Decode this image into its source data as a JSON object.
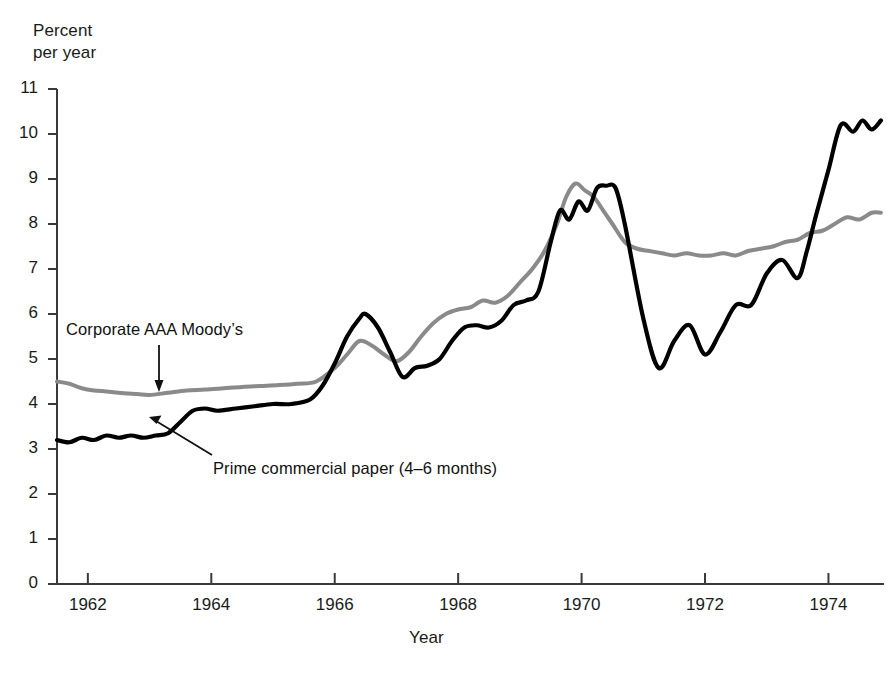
{
  "chart_data": {
    "type": "line",
    "title": "",
    "ylabel": "Percent\nper year",
    "xlabel": "Year",
    "ylim": [
      0,
      11
    ],
    "xlim": [
      1961.5,
      1974.9
    ],
    "yticks": [
      0,
      1,
      2,
      3,
      4,
      5,
      6,
      7,
      8,
      9,
      10,
      11
    ],
    "ytick_labels": [
      "0",
      "1",
      "2",
      "3",
      "4",
      "5",
      "6",
      "7",
      "8",
      "9",
      "10",
      "11"
    ],
    "xticks": [
      1962,
      1964,
      1966,
      1968,
      1970,
      1972,
      1974
    ],
    "xtick_labels": [
      "1962",
      "1964",
      "1966",
      "1968",
      "1970",
      "1972",
      "1974"
    ],
    "grid": false,
    "legend_position": "inline-annotations",
    "annotations": [
      {
        "name": "corporate-aaa-moodys-label",
        "text": "Corporate AAA Moody’s",
        "points_to_series": "Corporate AAA Moody’s",
        "arrow": "down"
      },
      {
        "name": "prime-commercial-paper-label",
        "text": "Prime commercial paper (4–6 months)",
        "points_to_series": "Prime commercial paper (4–6 months)",
        "arrow": "up-left"
      }
    ],
    "series": [
      {
        "name": "Corporate AAA Moody’s",
        "color": "#8a8a8a",
        "width": 4.0,
        "x": [
          1961.5,
          1961.7,
          1961.9,
          1962.1,
          1962.3,
          1962.5,
          1962.8,
          1963.0,
          1963.3,
          1963.6,
          1963.9,
          1964.2,
          1964.5,
          1964.8,
          1965.1,
          1965.4,
          1965.7,
          1966.0,
          1966.2,
          1966.4,
          1966.6,
          1966.8,
          1967.0,
          1967.2,
          1967.4,
          1967.6,
          1967.8,
          1968.0,
          1968.2,
          1968.4,
          1968.6,
          1968.8,
          1969.0,
          1969.2,
          1969.4,
          1969.6,
          1969.75,
          1969.9,
          1970.05,
          1970.2,
          1970.35,
          1970.5,
          1970.7,
          1970.9,
          1971.1,
          1971.3,
          1971.5,
          1971.7,
          1971.9,
          1972.1,
          1972.3,
          1972.5,
          1972.7,
          1972.9,
          1973.1,
          1973.3,
          1973.5,
          1973.7,
          1973.9,
          1974.1,
          1974.3,
          1974.5,
          1974.7,
          1974.85
        ],
        "y": [
          4.5,
          4.45,
          4.35,
          4.3,
          4.28,
          4.25,
          4.22,
          4.2,
          4.25,
          4.3,
          4.32,
          4.35,
          4.38,
          4.4,
          4.42,
          4.45,
          4.5,
          4.8,
          5.1,
          5.4,
          5.3,
          5.1,
          4.95,
          5.15,
          5.5,
          5.8,
          6.0,
          6.1,
          6.15,
          6.3,
          6.25,
          6.4,
          6.7,
          7.0,
          7.4,
          8.0,
          8.6,
          8.9,
          8.75,
          8.6,
          8.3,
          8.0,
          7.6,
          7.45,
          7.4,
          7.35,
          7.3,
          7.35,
          7.3,
          7.3,
          7.35,
          7.3,
          7.4,
          7.45,
          7.5,
          7.6,
          7.65,
          7.8,
          7.85,
          8.0,
          8.15,
          8.1,
          8.25,
          8.25
        ]
      },
      {
        "name": "Prime commercial paper (4–6 months)",
        "color": "#000000",
        "width": 4.2,
        "x": [
          1961.5,
          1961.7,
          1961.9,
          1962.1,
          1962.3,
          1962.5,
          1962.7,
          1962.9,
          1963.1,
          1963.3,
          1963.5,
          1963.7,
          1963.9,
          1964.1,
          1964.4,
          1964.7,
          1965.0,
          1965.3,
          1965.6,
          1965.8,
          1966.0,
          1966.2,
          1966.4,
          1966.5,
          1966.7,
          1966.9,
          1967.1,
          1967.3,
          1967.5,
          1967.7,
          1967.9,
          1968.1,
          1968.3,
          1968.5,
          1968.7,
          1968.9,
          1969.1,
          1969.3,
          1969.5,
          1969.65,
          1969.8,
          1969.95,
          1970.1,
          1970.25,
          1970.4,
          1970.55,
          1970.7,
          1971.0,
          1971.25,
          1971.5,
          1971.75,
          1972.0,
          1972.25,
          1972.5,
          1972.75,
          1973.0,
          1973.25,
          1973.5,
          1973.65,
          1973.8,
          1974.0,
          1974.2,
          1974.4,
          1974.55,
          1974.7,
          1974.85
        ],
        "y": [
          3.2,
          3.15,
          3.25,
          3.2,
          3.3,
          3.25,
          3.3,
          3.25,
          3.3,
          3.35,
          3.6,
          3.85,
          3.9,
          3.85,
          3.9,
          3.95,
          4.0,
          4.0,
          4.1,
          4.4,
          4.9,
          5.5,
          5.9,
          6.0,
          5.7,
          5.15,
          4.6,
          4.8,
          4.85,
          5.0,
          5.4,
          5.7,
          5.75,
          5.7,
          5.85,
          6.2,
          6.3,
          6.5,
          7.6,
          8.3,
          8.1,
          8.5,
          8.3,
          8.8,
          8.85,
          8.8,
          8.0,
          5.9,
          4.8,
          5.4,
          5.75,
          5.1,
          5.6,
          6.2,
          6.2,
          6.9,
          7.2,
          6.8,
          7.4,
          8.2,
          9.2,
          10.2,
          10.05,
          10.3,
          10.1,
          10.3
        ]
      }
    ]
  }
}
